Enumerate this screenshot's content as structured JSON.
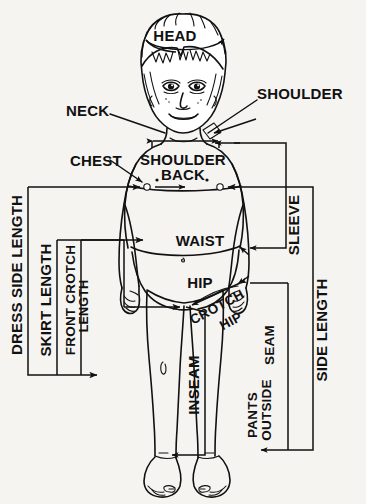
{
  "diagram": {
    "type": "technical-illustration",
    "background_color": "#f6f4f1",
    "line_color": "#111111",
    "width": 366,
    "height": 504
  },
  "labels": {
    "head": "HEAD",
    "neck": "NECK",
    "shoulder": "SHOULDER",
    "chest": "CHEST",
    "shoulder_back_line1": "SHOULDER",
    "shoulder_back_line2": "BACK",
    "waist": "WAIST",
    "hip": "HIP",
    "sleeve": "SLEEVE",
    "side_length": "SIDE  LENGTH",
    "dress_side_length": "DRESS SIDE LENGTH",
    "skirt_length": "SKIRT  LENGTH",
    "front_crotch_line1": "FRONT CROTCH",
    "front_crotch_line2": "LENGTH",
    "crotch_hip_line1": "CROTCH",
    "crotch_hip_line2": "HIP",
    "inseam": "INSEAM",
    "pants_outside_line1": "PANTS",
    "pants_outside_line2": "OUTSIDE",
    "pants_outside_line3": "SEAM"
  },
  "measurements": [
    {
      "name": "HEAD",
      "kind": "circumference",
      "orientation": "horizontal"
    },
    {
      "name": "NECK",
      "kind": "point",
      "orientation": "leader"
    },
    {
      "name": "SHOULDER",
      "kind": "point",
      "orientation": "leader"
    },
    {
      "name": "CHEST",
      "kind": "width",
      "orientation": "horizontal"
    },
    {
      "name": "SHOULDER BACK",
      "kind": "width",
      "orientation": "horizontal"
    },
    {
      "name": "WAIST",
      "kind": "width",
      "orientation": "horizontal"
    },
    {
      "name": "HIP",
      "kind": "width",
      "orientation": "horizontal"
    },
    {
      "name": "SLEEVE",
      "kind": "length",
      "orientation": "vertical-bracket"
    },
    {
      "name": "SIDE LENGTH",
      "kind": "length",
      "orientation": "vertical-bracket"
    },
    {
      "name": "DRESS SIDE LENGTH",
      "kind": "length",
      "orientation": "vertical-bracket"
    },
    {
      "name": "SKIRT LENGTH",
      "kind": "length",
      "orientation": "vertical-bracket"
    },
    {
      "name": "FRONT CROTCH LENGTH",
      "kind": "length",
      "orientation": "vertical-bracket"
    },
    {
      "name": "CROTCH HIP",
      "kind": "diagonal",
      "orientation": "diagonal"
    },
    {
      "name": "INSEAM",
      "kind": "length",
      "orientation": "vertical-bracket"
    },
    {
      "name": "PANTS OUTSIDE SEAM",
      "kind": "length",
      "orientation": "vertical-bracket"
    }
  ]
}
